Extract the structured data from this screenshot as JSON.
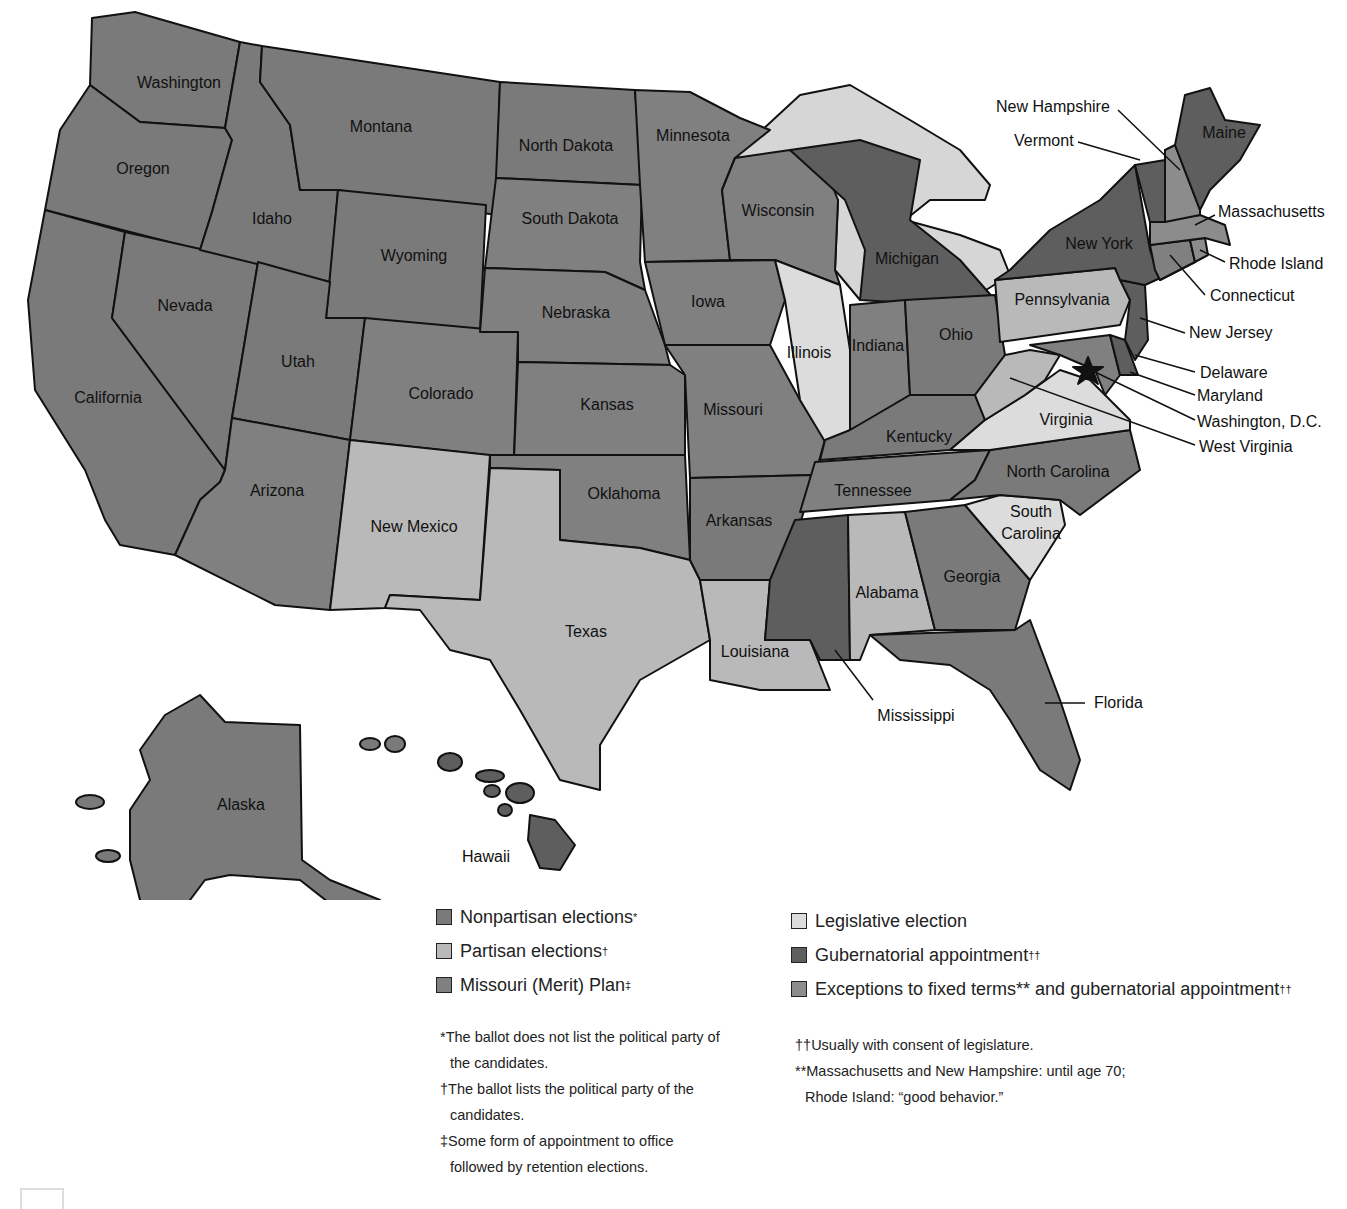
{
  "colors": {
    "nonpartisan": "#7a7a7a",
    "partisan": "#b9b9b9",
    "merit": "#808080",
    "legislative": "#dcdcdc",
    "gubernatorial": "#5e5e5e",
    "exceptions": "#8c8c8c",
    "water": "#d6d6d6"
  },
  "states": {
    "washington": "Washington",
    "oregon": "Oregon",
    "california": "California",
    "nevada": "Nevada",
    "idaho": "Idaho",
    "montana": "Montana",
    "wyoming": "Wyoming",
    "utah": "Utah",
    "arizona": "Arizona",
    "colorado": "Colorado",
    "new_mexico": "New Mexico",
    "north_dakota": "North Dakota",
    "south_dakota": "South Dakota",
    "nebraska": "Nebraska",
    "kansas": "Kansas",
    "oklahoma": "Oklahoma",
    "texas": "Texas",
    "minnesota": "Minnesota",
    "iowa": "Iowa",
    "missouri": "Missouri",
    "arkansas": "Arkansas",
    "louisiana": "Louisiana",
    "wisconsin": "Wisconsin",
    "illinois": "Illinois",
    "michigan": "Michigan",
    "indiana": "Indiana",
    "ohio": "Ohio",
    "kentucky": "Kentucky",
    "tennessee": "Tennessee",
    "mississippi": "Mississippi",
    "alabama": "Alabama",
    "georgia": "Georgia",
    "florida": "Florida",
    "south_carolina": "South Carolina",
    "north_carolina": "North Carolina",
    "virginia": "Virginia",
    "west_virginia": "West Virginia",
    "pennsylvania": "Pennsylvania",
    "new_york": "New York",
    "new_jersey": "New Jersey",
    "delaware": "Delaware",
    "maryland": "Maryland",
    "washington_dc": "Washington, D.C.",
    "connecticut": "Connecticut",
    "rhode_island": "Rhode Island",
    "massachusetts": "Massachusetts",
    "vermont": "Vermont",
    "new_hampshire": "New Hampshire",
    "maine": "Maine",
    "alaska": "Alaska",
    "hawaii": "Hawaii"
  },
  "legend": {
    "left": [
      {
        "label": "Nonpartisan elections",
        "mark": "*",
        "swatch": "nonpartisan"
      },
      {
        "label": "Partisan elections",
        "mark": "†",
        "swatch": "partisan"
      },
      {
        "label": "Missouri (Merit) Plan",
        "mark": "‡",
        "swatch": "merit"
      }
    ],
    "right": [
      {
        "label": "Legislative election",
        "mark": "",
        "swatch": "legislative"
      },
      {
        "label": "Gubernatorial appointment",
        "mark": "††",
        "swatch": "gubernatorial"
      },
      {
        "label": "Exceptions to fixed terms** and gubernatorial appointment",
        "mark": "††",
        "swatch": "exceptions"
      }
    ]
  },
  "footnotes": {
    "left": [
      "*The ballot does not list the political party of the candidates.",
      "†The ballot lists the political party of the candidates.",
      "‡Some form of appointment to office followed by retention elections."
    ],
    "right": [
      "††Usually with consent of legislature.",
      "**Massachusetts and New Hampshire: until age 70;",
      "Rhode Island: “good behavior.”"
    ]
  }
}
